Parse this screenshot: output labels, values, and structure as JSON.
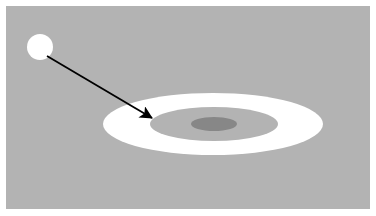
{
  "figure": {
    "canvas": {
      "width": 376,
      "height": 216,
      "background_color": "#ffffff"
    },
    "panel": {
      "name": "gray background panel",
      "x": 6,
      "y": 6,
      "width": 364,
      "height": 203,
      "fill_color": "#b3b3b3"
    },
    "shapes": {
      "source_disc": {
        "label": "small white disc",
        "cx": 40,
        "cy": 47,
        "r": 13,
        "fill_color": "#ffffff"
      },
      "outer_ring": {
        "label": "white elliptical annulus (outer)",
        "cx": 213,
        "cy": 124,
        "rx": 110,
        "ry": 31,
        "fill_color": "#ffffff"
      },
      "inner_ellipse": {
        "label": "gray inner ellipse",
        "cx": 214,
        "cy": 124,
        "rx": 64,
        "ry": 17,
        "fill_color": "#b3b3b3"
      },
      "core_ellipse": {
        "label": "dark gray core ellipse",
        "cx": 214,
        "cy": 124,
        "rx": 23,
        "ry": 7,
        "fill_color": "#878787"
      }
    },
    "arrow": {
      "label": "arrow from disc to ring interior",
      "start_x": 47,
      "start_y": 56,
      "end_x": 152,
      "end_y": 118,
      "stroke_color": "#000000",
      "stroke_width": 1.8,
      "head_length": 13,
      "head_width": 9
    }
  }
}
